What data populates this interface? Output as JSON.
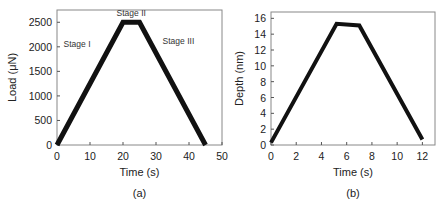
{
  "chart_data": [
    {
      "type": "line",
      "panel_label": "(a)",
      "xlabel": "Time (s)",
      "ylabel": "Load (μN)",
      "xlim": [
        0,
        50
      ],
      "ylim": [
        0,
        2750
      ],
      "xticks": [
        0,
        10,
        20,
        30,
        40,
        50
      ],
      "yticks": [
        0,
        500,
        1000,
        1500,
        2000,
        2500
      ],
      "series": [
        {
          "name": "Load",
          "x": [
            0,
            20,
            25,
            45
          ],
          "y": [
            0,
            2500,
            2500,
            0
          ]
        }
      ],
      "annotations": [
        {
          "text": "Stage I",
          "x": 2,
          "y": 2000
        },
        {
          "text": "Stage II",
          "x": 22.5,
          "y": 2620
        },
        {
          "text": "Stage III",
          "x": 32,
          "y": 2050
        }
      ]
    },
    {
      "type": "line",
      "panel_label": "(b)",
      "xlabel": "Time (s)",
      "ylabel": "Depth (nm)",
      "xlim": [
        0,
        13
      ],
      "ylim": [
        0,
        16.8
      ],
      "xticks": [
        0,
        2,
        4,
        6,
        8,
        10,
        12
      ],
      "yticks": [
        0,
        2,
        4,
        6,
        8,
        10,
        12,
        14,
        16
      ],
      "series": [
        {
          "name": "Depth",
          "x": [
            0,
            5.2,
            7.0,
            12
          ],
          "y": [
            0.3,
            15.3,
            15.1,
            0.7
          ]
        }
      ]
    }
  ]
}
